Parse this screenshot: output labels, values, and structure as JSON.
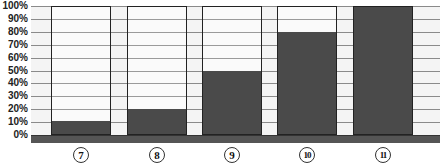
{
  "chart_data": {
    "type": "bar",
    "title": "",
    "xlabel": "",
    "ylabel": "",
    "categories": [
      "7",
      "8",
      "9",
      "10",
      "11"
    ],
    "category_labels": [
      "⑦",
      "⑧",
      "⑨",
      "⑩",
      "⑪"
    ],
    "values": [
      10,
      20,
      50,
      80,
      100
    ],
    "unit": "%",
    "ylim": [
      0,
      100
    ],
    "yticks": [
      "0%",
      "10%",
      "20%",
      "30%",
      "40%",
      "50%",
      "60%",
      "70%",
      "80%",
      "90%",
      "100%"
    ],
    "grid": true,
    "legend": null,
    "colors": {
      "fill": "#4a4a4a",
      "background": "#fafafa",
      "base": "#555555"
    }
  }
}
